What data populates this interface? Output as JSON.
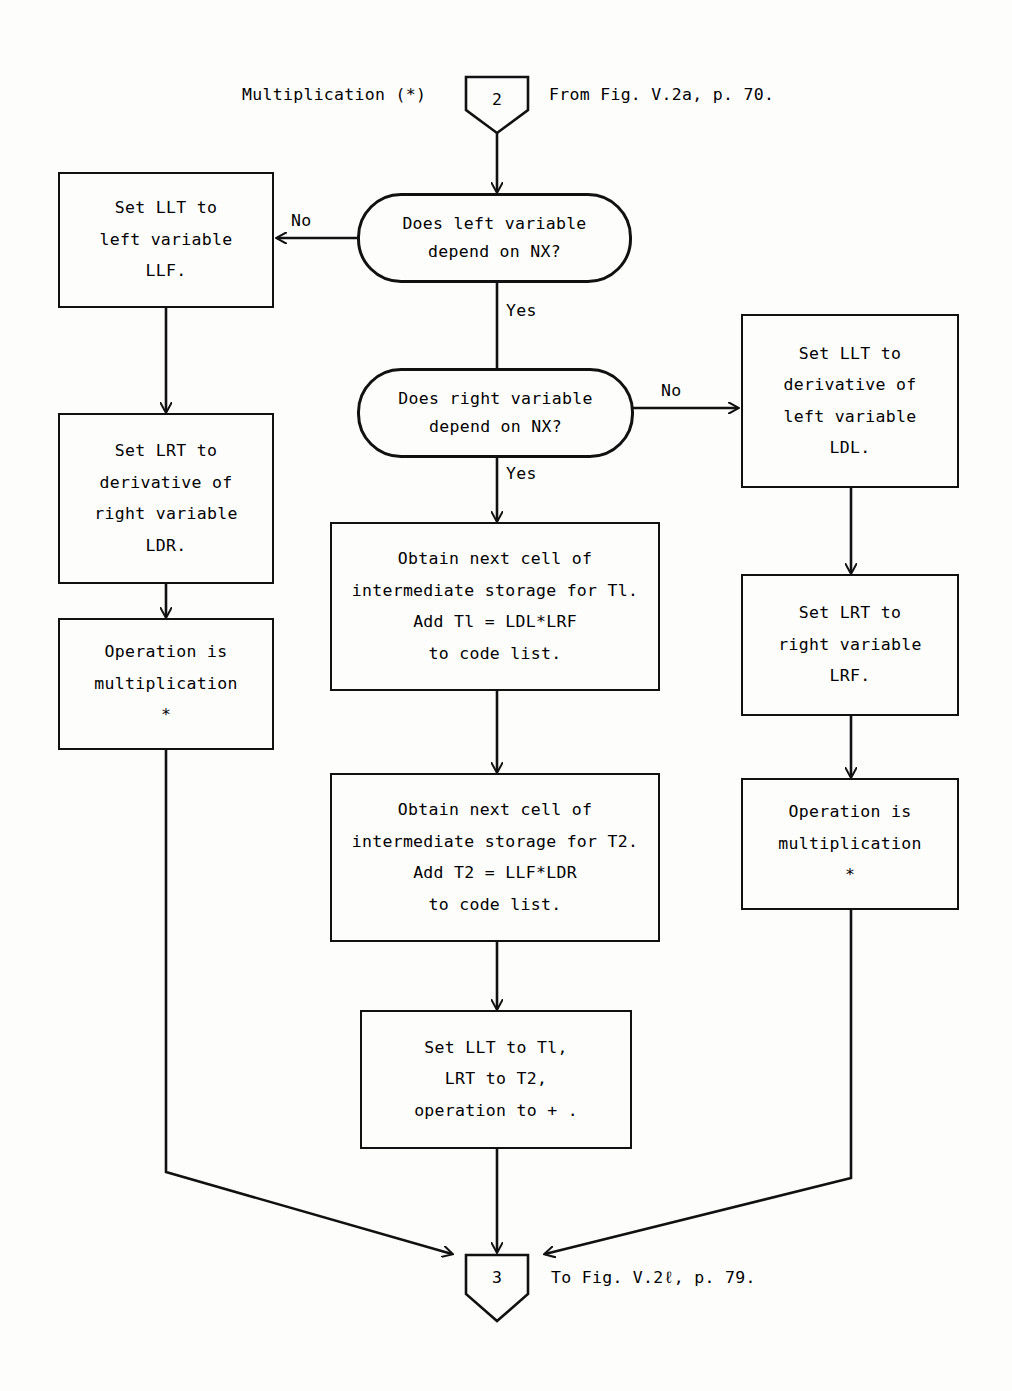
{
  "figure": {
    "header_left": "Multiplication (*)",
    "header_right": "From Fig. V.2a, p. 70.",
    "entry_connector": "2",
    "exit_connector": "3",
    "footer_right": "To Fig. V.2ℓ, p. 79."
  },
  "decisions": [
    {
      "id": "left-depends",
      "line1": "Does left variable",
      "line2": "depend on NX?",
      "no_label": "No",
      "yes_label": "Yes"
    },
    {
      "id": "right-depends",
      "line1": "Does right variable",
      "line2": "depend on NX?",
      "no_label": "No",
      "yes_label": "Yes"
    }
  ],
  "left_branch": {
    "set_llt": [
      "Set LLT to",
      "left variable",
      "LLF."
    ],
    "set_lrt": [
      "Set LRT to",
      "derivative of",
      "right variable",
      "LDR."
    ],
    "operation": [
      "Operation is",
      "multiplication",
      "*"
    ]
  },
  "center_branch": {
    "obtain_t1": [
      "Obtain next cell of",
      "intermediate storage for Tl.",
      "Add Tl = LDL*LRF",
      "to code list."
    ],
    "obtain_t2": [
      "Obtain next cell of",
      "intermediate storage for T2.",
      "Add T2 = LLF*LDR",
      "to code list."
    ],
    "set_final": [
      "Set LLT to Tl,",
      "LRT to T2,",
      "operation to + ."
    ]
  },
  "right_branch": {
    "set_llt": [
      "Set LLT to",
      "derivative of",
      "left variable",
      "LDL."
    ],
    "set_lrt": [
      "Set LRT to",
      "right variable",
      "LRF."
    ],
    "operation": [
      "Operation is",
      "multiplication",
      "*"
    ]
  },
  "colors": {
    "ink": "#111111",
    "paper": "#fdfdfc"
  }
}
